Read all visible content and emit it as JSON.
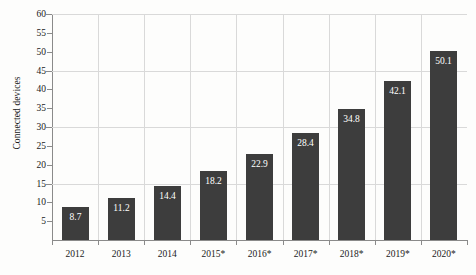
{
  "chart_data": {
    "type": "bar",
    "title": "",
    "subtitle": "",
    "xlabel": "",
    "ylabel": "Connected devices",
    "categories": [
      "2012",
      "2013",
      "2014",
      "2015*",
      "2016*",
      "2017*",
      "2018*",
      "2019*",
      "2020*"
    ],
    "values": [
      8.7,
      11.2,
      14.4,
      18.2,
      22.9,
      28.4,
      34.8,
      42.1,
      50.1
    ],
    "value_labels": [
      "8.7",
      "11.2",
      "14.4",
      "18.2",
      "22.9",
      "28.4",
      "34.8",
      "42.1",
      "50.1"
    ],
    "ylim": [
      0,
      60
    ],
    "y_ticks": [
      5,
      10,
      15,
      20,
      25,
      30,
      35,
      40,
      45,
      50,
      55,
      60
    ],
    "y_tick_labels": [
      "5",
      "10",
      "15",
      "20",
      "25",
      "30",
      "35",
      "40",
      "45",
      "50",
      "55",
      "60"
    ],
    "y_gridlines": [
      15,
      30,
      45,
      60
    ],
    "grid": true,
    "legend": "none",
    "bar_color": "#3d3d3d",
    "gridline_color": "#d9d9d9",
    "axis_color": "#8a8a8a",
    "value_label_color": "#ffffff",
    "background_color": "#fdfdfc"
  }
}
